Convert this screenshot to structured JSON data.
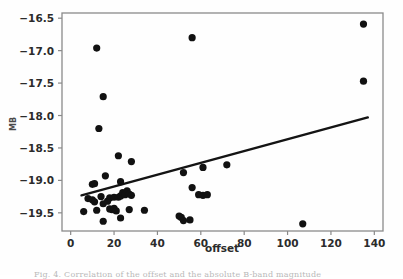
{
  "figure": {
    "background_color": "#fefefe",
    "axes_color": "#8a8a8a",
    "marker_color": "#111111",
    "line_color": "#141414",
    "caption_text": "Fig. 4. Correlation of the offset and the absolute B-band magnitude"
  },
  "chart_data": {
    "type": "scatter",
    "title": "",
    "xlabel": "offset",
    "ylabel": "M_B",
    "xlim": [
      -4,
      144
    ],
    "ylim": [
      -19.78,
      -16.42
    ],
    "grid": false,
    "legend": null,
    "xticks": [
      0,
      20,
      40,
      60,
      80,
      100,
      120,
      140
    ],
    "xtick_labels": [
      "0",
      "20",
      "40",
      "60",
      "80",
      "100",
      "120",
      "140"
    ],
    "yticks": [
      -16.5,
      -17.0,
      -17.5,
      -18.0,
      -18.5,
      -19.0,
      -19.5
    ],
    "ytick_labels": [
      "−16.5",
      "−17.0",
      "−17.5",
      "−18.0",
      "−18.5",
      "−19.0",
      "−19.5"
    ],
    "marker": "circle",
    "marker_size": 6,
    "points": [
      {
        "x": 6,
        "y": -19.48
      },
      {
        "x": 8,
        "y": -19.28
      },
      {
        "x": 10,
        "y": -19.06
      },
      {
        "x": 10,
        "y": -19.3
      },
      {
        "x": 11,
        "y": -19.05
      },
      {
        "x": 11,
        "y": -19.33
      },
      {
        "x": 12,
        "y": -16.96
      },
      {
        "x": 12,
        "y": -19.46
      },
      {
        "x": 13,
        "y": -18.2
      },
      {
        "x": 14,
        "y": -19.25
      },
      {
        "x": 15,
        "y": -17.71
      },
      {
        "x": 15,
        "y": -19.36
      },
      {
        "x": 15,
        "y": -19.63
      },
      {
        "x": 16,
        "y": -18.93
      },
      {
        "x": 17,
        "y": -19.32
      },
      {
        "x": 18,
        "y": -19.27
      },
      {
        "x": 18,
        "y": -19.44
      },
      {
        "x": 19,
        "y": -19.45
      },
      {
        "x": 20,
        "y": -19.26
      },
      {
        "x": 20,
        "y": -19.43
      },
      {
        "x": 21,
        "y": -19.47
      },
      {
        "x": 22,
        "y": -18.62
      },
      {
        "x": 22,
        "y": -19.26
      },
      {
        "x": 23,
        "y": -19.02
      },
      {
        "x": 23,
        "y": -19.24
      },
      {
        "x": 23,
        "y": -19.58
      },
      {
        "x": 24,
        "y": -19.19
      },
      {
        "x": 25,
        "y": -19.22
      },
      {
        "x": 26,
        "y": -19.16
      },
      {
        "x": 27,
        "y": -19.21
      },
      {
        "x": 27,
        "y": -19.45
      },
      {
        "x": 28,
        "y": -18.71
      },
      {
        "x": 28,
        "y": -19.23
      },
      {
        "x": 34,
        "y": -19.46
      },
      {
        "x": 50,
        "y": -19.55
      },
      {
        "x": 51,
        "y": -19.57
      },
      {
        "x": 52,
        "y": -18.88
      },
      {
        "x": 52,
        "y": -19.62
      },
      {
        "x": 55,
        "y": -19.61
      },
      {
        "x": 56,
        "y": -16.8
      },
      {
        "x": 56,
        "y": -19.11
      },
      {
        "x": 59,
        "y": -19.22
      },
      {
        "x": 61,
        "y": -18.8
      },
      {
        "x": 61,
        "y": -19.23
      },
      {
        "x": 63,
        "y": -19.22
      },
      {
        "x": 72,
        "y": -18.76
      },
      {
        "x": 107,
        "y": -19.67
      },
      {
        "x": 135,
        "y": -16.59
      },
      {
        "x": 135,
        "y": -17.47
      }
    ],
    "fit_line": {
      "type": "linear",
      "x_start": 5,
      "y_start": -19.23,
      "x_end": 137,
      "y_end": -18.03
    }
  }
}
